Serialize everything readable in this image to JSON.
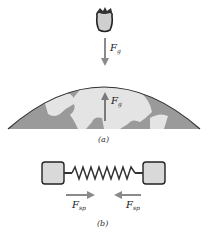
{
  "figure": {
    "part_a": {
      "caption": "(a)",
      "apple_force": {
        "symbol": "F",
        "subscript": "g",
        "direction": "down"
      },
      "earth_force": {
        "symbol": "F",
        "subscript": "g",
        "direction": "up"
      }
    },
    "part_b": {
      "caption": "(b)",
      "left_force": {
        "symbol": "F",
        "subscript": "sp",
        "direction": "right"
      },
      "right_force": {
        "symbol": "F",
        "subscript": "sp",
        "direction": "left"
      }
    }
  },
  "colors": {
    "arrow": "#8a8a8a",
    "ocean": "#9a9a9a",
    "land": "#e4e4e4",
    "block": "#d9d9d9",
    "outline": "#333333"
  }
}
